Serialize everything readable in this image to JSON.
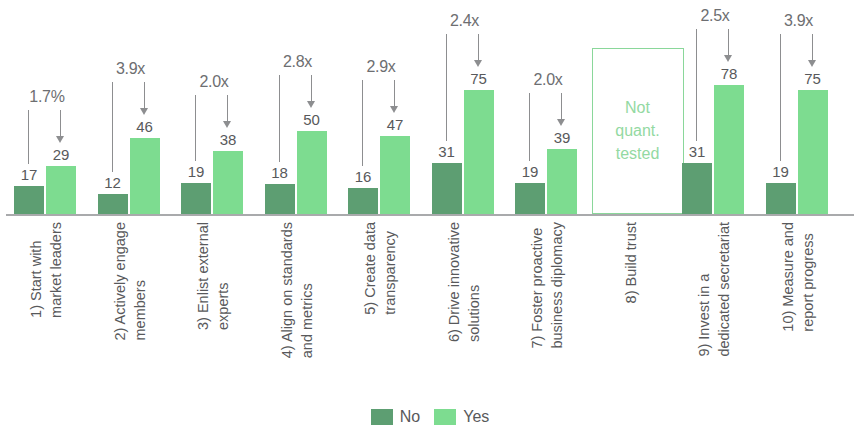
{
  "chart_data": {
    "type": "bar",
    "title": "",
    "subtitle": "",
    "xlabel": "",
    "ylabel": "",
    "ylim": [
      0,
      85
    ],
    "grid": false,
    "legend_position": "bottom",
    "categories": [
      "1) Start with market leaders",
      "2) Actively engage members",
      "3) Enlist external experts",
      "4) Align on standards and metrics",
      "5) Create data transparency",
      "6) Drive innovative solutions",
      "7) Foster proactive business diplomacy",
      "8) Build trust",
      "9) Invest in a dedicated secretariat",
      "10) Measure and report progress"
    ],
    "series": [
      {
        "name": "No",
        "color": "#5d9e72",
        "values": [
          17,
          12,
          19,
          18,
          16,
          31,
          19,
          null,
          31,
          19
        ]
      },
      {
        "name": "Yes",
        "color": "#7ddc90",
        "values": [
          29,
          46,
          38,
          50,
          47,
          75,
          39,
          null,
          78,
          75
        ]
      }
    ],
    "annotations": [
      "1.7%",
      "3.9x",
      "2.0x",
      "2.8x",
      "2.9x",
      "2.4x",
      "2.0x",
      null,
      "2.5x",
      "3.9x"
    ],
    "not_tested_index": 7,
    "not_tested_text": [
      "Not",
      "quant.",
      "tested"
    ]
  },
  "groups": [
    {
      "index": 0,
      "label_line1": "1) Start with",
      "label_line2": "market leaders",
      "no": "17",
      "yes": "29",
      "annotation": "1.7%",
      "not_tested": false
    },
    {
      "index": 1,
      "label_line1": "2) Actively engage",
      "label_line2": "members",
      "no": "12",
      "yes": "46",
      "annotation": "3.9x",
      "not_tested": false
    },
    {
      "index": 2,
      "label_line1": "3) Enlist external",
      "label_line2": "experts",
      "no": "19",
      "yes": "38",
      "annotation": "2.0x",
      "not_tested": false
    },
    {
      "index": 3,
      "label_line1": "4) Align on standards",
      "label_line2": "and metrics",
      "no": "18",
      "yes": "50",
      "annotation": "2.8x",
      "not_tested": false
    },
    {
      "index": 4,
      "label_line1": "5) Create data",
      "label_line2": "transparency",
      "no": "16",
      "yes": "47",
      "annotation": "2.9x",
      "not_tested": false
    },
    {
      "index": 5,
      "label_line1": "6) Drive innovative",
      "label_line2": "solutions",
      "no": "31",
      "yes": "75",
      "annotation": "2.4x",
      "not_tested": false
    },
    {
      "index": 6,
      "label_line1": "7) Foster proactive",
      "label_line2": "business diplomacy",
      "no": "19",
      "yes": "39",
      "annotation": "2.0x",
      "not_tested": false
    },
    {
      "index": 7,
      "label_line1": "8) Build trust",
      "label_line2": "",
      "no": "",
      "yes": "",
      "annotation": "",
      "not_tested": true,
      "nq_line1": "Not",
      "nq_line2": "quant.",
      "nq_line3": "tested"
    },
    {
      "index": 8,
      "label_line1": "9) Invest in a",
      "label_line2": "dedicated secretariat",
      "no": "31",
      "yes": "78",
      "annotation": "2.5x",
      "not_tested": false
    },
    {
      "index": 9,
      "label_line1": "10) Measure and",
      "label_line2": "report progress",
      "no": "19",
      "yes": "75",
      "annotation": "3.9x",
      "not_tested": false
    }
  ],
  "legend": {
    "no_label": "No",
    "yes_label": "Yes"
  },
  "colors": {
    "no": "#5d9e72",
    "yes": "#7ddc90",
    "axis": "#a9aaac",
    "text": "#58595b",
    "annotation": "#8d8e90",
    "not_tested_border": "#8ad79a",
    "not_tested_text": "#93d9a2"
  }
}
